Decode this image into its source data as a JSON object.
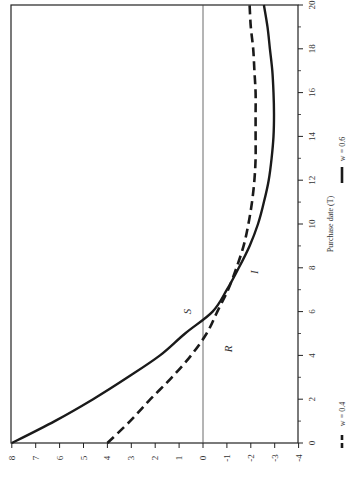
{
  "chart_data": {
    "type": "line",
    "title": "",
    "orientation": "rotated 90 degrees counter-clockwise (x-axis runs vertically on the right, y-axis horizontally along the bottom)",
    "xlabel": "Purchase date (T)",
    "ylabel": "",
    "xlim": [
      0,
      20
    ],
    "ylim": [
      -4,
      8
    ],
    "x_ticks": [
      0,
      2,
      4,
      6,
      8,
      10,
      12,
      14,
      16,
      18,
      20
    ],
    "y_ticks": [
      8,
      7,
      6,
      5,
      4,
      3,
      2,
      1,
      0,
      -1,
      -2,
      -3,
      -4
    ],
    "grid": false,
    "reference_line": {
      "y": 0
    },
    "x": [
      0,
      1,
      2,
      3,
      4,
      5,
      6,
      7,
      8,
      9,
      10,
      11,
      12,
      13,
      14,
      15,
      16,
      17,
      18,
      19,
      20
    ],
    "series": [
      {
        "name": "w = 0.4",
        "style": "dashed",
        "values": [
          4.0,
          3.05,
          2.2,
          1.3,
          0.5,
          -0.15,
          -0.6,
          -1.05,
          -1.4,
          -1.7,
          -1.9,
          -2.05,
          -2.15,
          -2.2,
          -2.2,
          -2.2,
          -2.2,
          -2.15,
          -2.1,
          -2.0,
          -1.95
        ]
      },
      {
        "name": "w = 0.6",
        "style": "solid",
        "values": [
          8.0,
          6.2,
          4.6,
          3.15,
          1.8,
          0.75,
          -0.4,
          -1.0,
          -1.5,
          -1.95,
          -2.3,
          -2.55,
          -2.75,
          -2.87,
          -2.95,
          -2.97,
          -2.95,
          -2.9,
          -2.8,
          -2.7,
          -2.55
        ]
      }
    ],
    "annotations": [
      {
        "text": "S",
        "x": 6.0,
        "y": 0.5
      },
      {
        "text": "R",
        "x": 4.3,
        "y": -1.2
      },
      {
        "text": "I",
        "x": 7.8,
        "y": -2.3
      }
    ],
    "legend": {
      "position": "right (below x-axis title, rotated)",
      "entries": [
        "w = 0.4",
        "w = 0.6"
      ]
    }
  }
}
